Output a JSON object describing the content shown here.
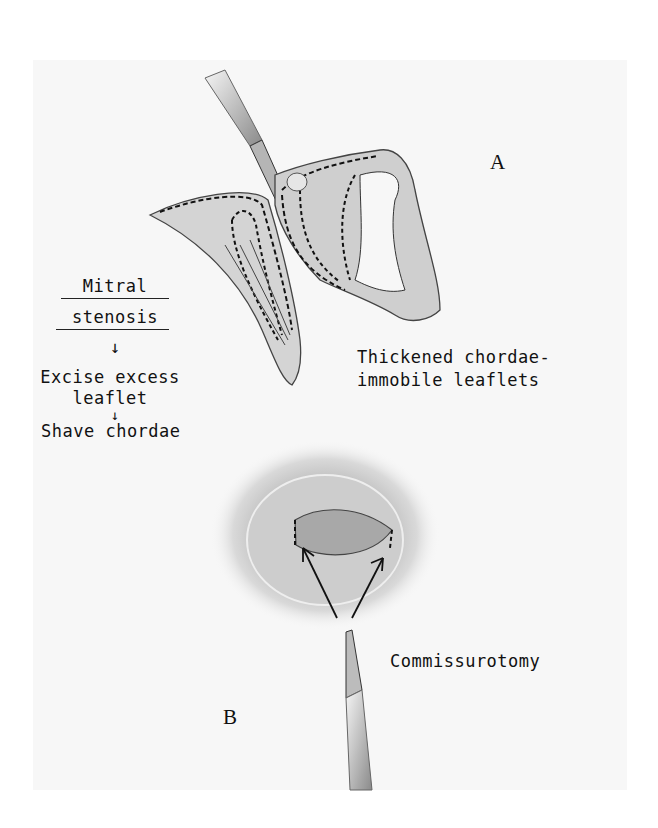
{
  "figure": {
    "panel_a": {
      "letter": "A",
      "caption_line1": "Thickened chordae-",
      "caption_line2": "immobile leaflets"
    },
    "panel_b": {
      "letter": "B",
      "caption": "Commissurotomy"
    },
    "flow": {
      "title_line1": "Mitral",
      "title_line2": "stenosis",
      "arrow1": "↓",
      "step1_line1": "Excise excess",
      "step1_line2": "leaflet",
      "arrow2": "↓",
      "step2": "Shave chordae"
    }
  }
}
